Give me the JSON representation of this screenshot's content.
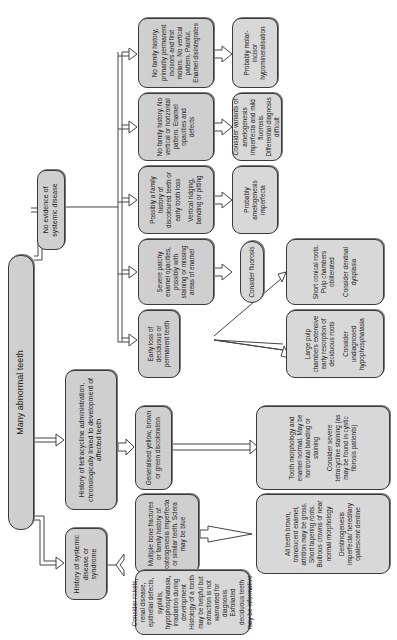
{
  "title": "Many abnormal teeth",
  "branches": {
    "systemic": {
      "label": "History of systemic disease or syndrome",
      "bone": "Multiple bone fractures or family history of osteogenesis imperfecta or similar teeth. Sclera may be blue",
      "bone_result_a": "All teeth brown, translucent enamel, attrition may be gross. Short tapering roots. Bulbous crowns of near normal morphology",
      "bone_result_b": "Dentinogenesis imperfecta/ hereditary opalescent dentine",
      "consider_a": "Consider rickets, renal disease, epithelial defects, syphilis, hypophosphatasia, irradiation during development",
      "consider_b": "Histology of a tooth may be helpful but extraction is not warranted for diagnosis. Exfoliated deciduous teeth may be informative"
    },
    "tetracycline": {
      "label": "History of tetracycline administration, chronologically linked to development of affected teeth",
      "discoloration": "Generalised yellow, brown or green discoloration",
      "result_a": "Tooth morphology and enamel normal. May be horizontal banding or staining",
      "result_b": "Consider severe tetracycline staining (as may be found in cystic fibrosis patients)"
    },
    "no_systemic": {
      "label": "No evidence of systemic disease",
      "children": [
        {
          "label": "Early loss of deciduous or permanent teeth",
          "sub": [
            {
              "a": "Large pulp chambers extensive early resorption of deciduous roots",
              "b": "Consider undiagnosed hypophosphatasia"
            },
            {
              "a": "Short conical roots. Pulp chambers obliterated",
              "b": "Consider dentinal dysplasia"
            }
          ]
        },
        {
          "label": "Severe patchy enamel opacities, possibly with staining or missing areas of enamel",
          "result": "Consider fluorosis"
        },
        {
          "label_a": "Possibly a family history of discoloured teeth or early tooth loss",
          "label_b": "Vertical ridging, banding or pitting",
          "result": "Probably amelogenesis imperfecta"
        },
        {
          "label": "No family history. No vertical or horizontal pattern. Enamel opacities and defects",
          "result_a": "Consider variants of amelogenesis imperfecta and mild fluorosis.",
          "result_b": "Differential diagnosis difficult"
        },
        {
          "label": "No family history, primarily permanent incisors and first molars. No vertical pattern. Painful. Enamel disintegrates",
          "result": "Probably molar-incisor hypomineralisation"
        }
      ]
    }
  },
  "colors": {
    "box_fill": "#cfcfcf",
    "box_border": "#3a3a3a",
    "background": "#ffffff"
  }
}
